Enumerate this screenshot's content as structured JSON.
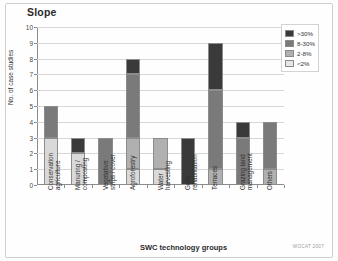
{
  "chart_data": {
    "type": "bar",
    "stacked": true,
    "title": "Slope",
    "xlabel": "SWC technology groups",
    "ylabel": "No. of case studies",
    "ylim": [
      0,
      10
    ],
    "yticks": [
      0,
      1,
      2,
      3,
      4,
      5,
      6,
      7,
      8,
      9,
      10
    ],
    "ytick_labels": [
      "0",
      "1",
      "2",
      "3",
      "4",
      "5",
      "6",
      "7",
      "8",
      "9",
      "10"
    ],
    "grid": true,
    "legend_position": "top-right",
    "categories": [
      "Conservation agriculture",
      "Manuring / composting",
      "Vegetative strips / cover",
      "Agroforestry",
      "Water harvesting",
      "Gully rehabilitation",
      "Terraces",
      "Grazing land management",
      "Others"
    ],
    "category_lines": [
      "Conservation\nagriculture",
      "Manuring /\ncomposting",
      "Vegetative\nstrips / cover",
      "Agroforestry",
      "Water\nharvesting",
      "Gully\nrehabilitation",
      "Terraces",
      "Grazing land\nmanagement",
      "Others"
    ],
    "series": [
      {
        "name": "<2%",
        "color": "#d9d9d9",
        "values": [
          3,
          2,
          0,
          1,
          1,
          0,
          0,
          0,
          0
        ]
      },
      {
        "name": "2-8%",
        "color": "#b0b0b0",
        "values": [
          0,
          0,
          0,
          2,
          2,
          0,
          1,
          0,
          1
        ]
      },
      {
        "name": "8-30%",
        "color": "#7a7a7a",
        "values": [
          2,
          0,
          3,
          4,
          0,
          0,
          5,
          3,
          3
        ]
      },
      {
        "name": ">30%",
        "color": "#3a3a3a",
        "values": [
          0,
          1,
          0,
          1,
          0,
          3,
          3,
          1,
          0
        ]
      }
    ],
    "totals": [
      5,
      3,
      3,
      8,
      3,
      3,
      9,
      4,
      4
    ],
    "credit": "WOCAT 2007"
  },
  "legend": {
    "entries": [
      {
        "label": ">30%",
        "color": "#3a3a3a"
      },
      {
        "label": "8-30%",
        "color": "#7a7a7a"
      },
      {
        "label": "2-8%",
        "color": "#b0b0b0"
      },
      {
        "label": "<2%",
        "color": "#e6e6e6"
      }
    ]
  }
}
